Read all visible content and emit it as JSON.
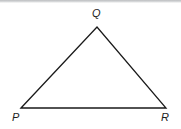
{
  "figure": {
    "kind": "geometry-diagram",
    "shape": "triangle",
    "background_color": "#ffffff",
    "stroke_color": "#1a1a1a",
    "label_color": "#1d1d1d",
    "artifact": {
      "name": "scan-band-top",
      "color": "#c2c4c6"
    },
    "vertices": [
      {
        "id": "P",
        "label": "P",
        "x": 21,
        "y": 108
      },
      {
        "id": "Q",
        "label": "Q",
        "x": 97,
        "y": 27
      },
      {
        "id": "R",
        "label": "R",
        "x": 166,
        "y": 108
      }
    ],
    "edges": [
      {
        "id": "PQ",
        "from": "P",
        "to": "Q"
      },
      {
        "id": "QR",
        "from": "Q",
        "to": "R"
      },
      {
        "id": "RP",
        "from": "R",
        "to": "P"
      }
    ],
    "polygon_points": "21,108 97,27 166,108",
    "stroke_width": 1.3
  }
}
